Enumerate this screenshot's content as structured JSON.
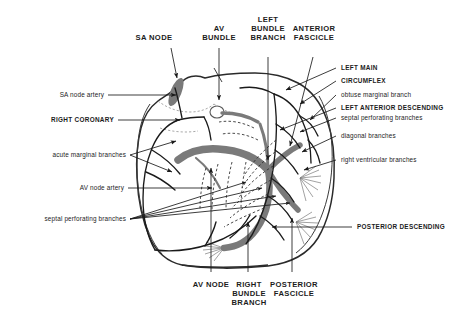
{
  "figure": {
    "background_color": "#ffffff",
    "conduction_color": "#7a7a7a",
    "artery_color": "#1a1a1a",
    "outline_color": "#2a2a2a"
  },
  "labels": {
    "top": [
      {
        "id": "sa-node",
        "text": "SA NODE",
        "style": "caps"
      },
      {
        "id": "av-bundle",
        "text": "AV\nBUNDLE",
        "style": "caps"
      },
      {
        "id": "left-bundle-branch",
        "text": "LEFT\nBUNDLE\nBRANCH",
        "style": "caps"
      },
      {
        "id": "anterior-fascicle",
        "text": "ANTERIOR\nFASCICLE",
        "style": "caps"
      }
    ],
    "top_lines": {
      "sa_node": "SA NODE",
      "av_bundle_1": "AV",
      "av_bundle_2": "BUNDLE",
      "lbb_1": "LEFT",
      "lbb_2": "BUNDLE",
      "lbb_3": "BRANCH",
      "ant_fasc_1": "ANTERIOR",
      "ant_fasc_2": "FASCICLE"
    },
    "left": [
      {
        "id": "sa-node-artery",
        "text": "SA node artery",
        "style": "lower"
      },
      {
        "id": "right-coronary",
        "text": "RIGHT CORONARY",
        "style": "caps"
      },
      {
        "id": "acute-marginal-branches",
        "text": "acute marginal branches",
        "style": "lower"
      },
      {
        "id": "av-node-artery",
        "text": "AV node artery",
        "style": "lower"
      },
      {
        "id": "septal-perforating-branches-left",
        "text": "septal perforating branches",
        "style": "lower"
      }
    ],
    "right": [
      {
        "id": "left-main",
        "text": "LEFT MAIN",
        "style": "caps"
      },
      {
        "id": "circumflex",
        "text": "CIRCUMFLEX",
        "style": "caps"
      },
      {
        "id": "obtuse-marginal-branch",
        "text": "obtuse marginal branch",
        "style": "lower"
      },
      {
        "id": "left-anterior-descending",
        "text": "LEFT ANTERIOR DESCENDING",
        "style": "caps"
      },
      {
        "id": "septal-perforating-branches-right",
        "text": "septal perforating branches",
        "style": "lower"
      },
      {
        "id": "diagonal-branches",
        "text": "diagonal branches",
        "style": "lower"
      },
      {
        "id": "right-ventricular-branches",
        "text": "right ventricular branches",
        "style": "lower"
      },
      {
        "id": "posterior-descending",
        "text": "POSTERIOR DESCENDING",
        "style": "caps"
      }
    ],
    "bottom": [
      {
        "id": "av-node",
        "text": "AV NODE",
        "style": "caps"
      },
      {
        "id": "right-bundle-branch",
        "text": "RIGHT\nBUNDLE\nBRANCH",
        "style": "caps"
      },
      {
        "id": "posterior-fascicle",
        "text": "POSTERIOR\nFASCICLE",
        "style": "caps"
      }
    ],
    "bottom_lines": {
      "av_node": "AV NODE",
      "rbb_1": "RIGHT",
      "rbb_2": "BUNDLE",
      "rbb_3": "BRANCH",
      "post_fasc_1": "POSTERIOR",
      "post_fasc_2": "FASCICLE"
    }
  }
}
